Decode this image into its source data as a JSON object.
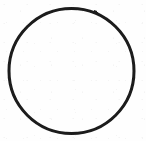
{
  "figure": {
    "title": "Circle outline",
    "shape_kind": "circle",
    "rendering": "scanned line drawing",
    "canvas": {
      "width": 146,
      "height": 141,
      "background_color": "#fefefe"
    },
    "circle": {
      "center_x": 71.5,
      "center_y": 71.0,
      "radius": 64.0,
      "stroke_color": "#1a1a1a",
      "stroke_width": 3.0,
      "fill_color": "none",
      "bounds": {
        "left": 6,
        "top": 7,
        "right": 137,
        "bottom": 135
      }
    },
    "text_content": "",
    "annotations": []
  }
}
